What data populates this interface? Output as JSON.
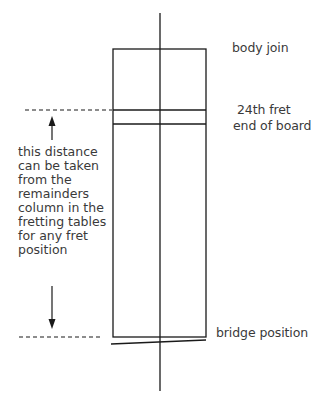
{
  "diagram": {
    "labels": {
      "body_join": "body join",
      "fret_24": "24th fret",
      "end_of_board": "end of board",
      "bridge_position": "bridge position"
    },
    "note_lines": [
      "this distance",
      "can be taken",
      "from the",
      "remainders",
      "column in the",
      "fretting tables",
      "for any fret",
      "position"
    ],
    "colors": {
      "line": "#1a1a1a",
      "text": "#3a3a3a",
      "background": "#ffffff"
    }
  }
}
